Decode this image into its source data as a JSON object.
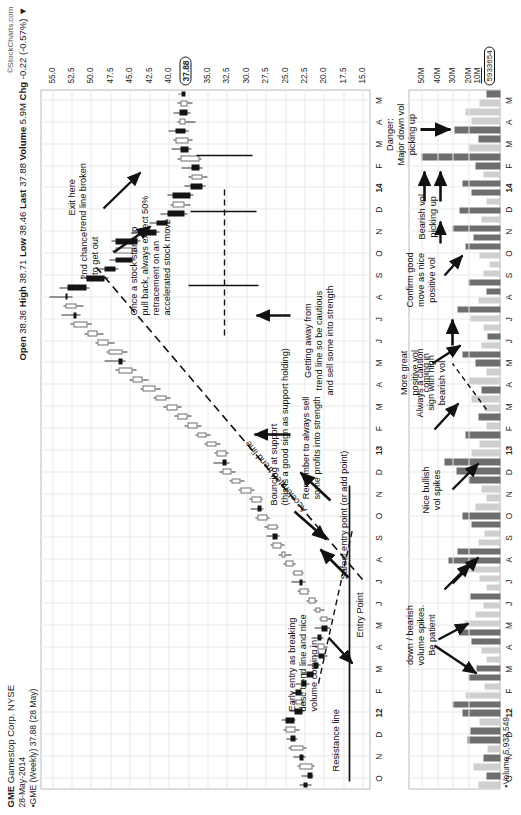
{
  "header": {
    "symbol": "GME",
    "company": "Gamestop Corp. NYSE",
    "date": "28-May-2014",
    "series_label": "GME (Weekly) 37.88 (28 May)",
    "credit": "©StockCharts.com",
    "open_label": "Open",
    "open_value": "38.36",
    "high_label": "High",
    "high_value": "38.71",
    "low_label": "Low",
    "low_value": "38.46",
    "last_label": "Last",
    "last_value": "37.88",
    "volume_label": "Volume",
    "volume_value": "5.9M",
    "chg_label": "Chg",
    "chg_value": "-0.22 (-0.57%)",
    "chg_arrow": "▼"
  },
  "price_axis": {
    "ticks": [
      "55.0",
      "52.5",
      "50.0",
      "47.5",
      "45.0",
      "42.5",
      "40.0",
      "35.0",
      "32.5",
      "30.0",
      "27.5",
      "25.0",
      "22.5",
      "20.0",
      "17.5",
      "15.0"
    ],
    "last_marker": "37.88",
    "min": 14.0,
    "max": 56.5
  },
  "volume_axis": {
    "ticks": [
      "50M",
      "40M",
      "30M",
      "20M"
    ],
    "base_tick": "10M",
    "last_marker": "5933654",
    "footer": "Volume 5,933,549",
    "max": 58
  },
  "x_axis": {
    "labels": [
      "O",
      "N",
      "D",
      "12",
      "F",
      "M",
      "A",
      "M",
      "J",
      "J",
      "A",
      "S",
      "O",
      "N",
      "D",
      "13",
      "F",
      "M",
      "A",
      "M",
      "J",
      "J",
      "A",
      "S",
      "O",
      "N",
      "D",
      "14",
      "F",
      "M",
      "A",
      "M"
    ],
    "bold": [
      "12",
      "13",
      "14"
    ]
  },
  "annotations": {
    "exit_here": "Exit here\ntrend line broken",
    "second_chance": "2nd chance\nto get out",
    "accelerated_trend_line": "Accelerated trend line",
    "getting_away": "Getting away from\ntrend line so be cautious\nand sell some into strength",
    "remember_to_sell": "Remember to always sell\nsome profits into strength",
    "once_a_stock": "Once a stock starts to\npull back, always expect 50%\nretracement on an\naccelerated stock move",
    "safest_entry": "Safest entry point (or add point)",
    "entry_point": "Entry Point",
    "bouncing_at_support": "Bouncing at support\n(this is a good sign as support holding)",
    "early_entry": "Early entry as breaking\ndesc trend line and nice\nvolume coming in",
    "resistance_line": "Resistance line",
    "always_caution": "Always a caution\nsign with high\nbearish vol",
    "nice_bullish_vol": "Nice bullish\nvol spikes",
    "down_bearish": "down / bearish\nvolume spikes.\nBe patient",
    "more_great_vol": "More great\npositive vol\ncoming in",
    "confirm_good_move": "Confirm good\nmove as nice\npositive vol",
    "bearish_vol_picking": "Bearish vol\npicking up",
    "danger_major": "Danger:\nMajor down vol\npicking up"
  },
  "colors": {
    "up_body": "#ffffff",
    "down_body": "#141414",
    "up_volume": "#cfcfcf",
    "down_volume": "#6e6e6e",
    "grid": "#e9e9e9",
    "frame": "#b9b9b9",
    "text": "#111111"
  },
  "chart_data": {
    "type": "candlestick",
    "xlabel": "",
    "ylabel": "Price",
    "ylim": [
      14.0,
      56.5
    ],
    "volume_ylim": [
      0,
      58
    ],
    "grid": true,
    "legend": "none",
    "x": [
      "O",
      "N",
      "D",
      "12",
      "F",
      "M",
      "A",
      "M",
      "J",
      "J",
      "A",
      "S",
      "O",
      "N",
      "D",
      "13",
      "F",
      "M",
      "A",
      "M",
      "J",
      "J",
      "A",
      "S",
      "O",
      "N",
      "D",
      "14",
      "F",
      "M",
      "A",
      "M"
    ],
    "series": [
      {
        "name": "GME weekly OHLC",
        "ohlc": [
          [
            22.6,
            23.2,
            21.6,
            22.1
          ],
          [
            22.1,
            22.9,
            21.3,
            21.5
          ],
          [
            21.5,
            23.4,
            21.2,
            23.1
          ],
          [
            23.1,
            23.9,
            22.4,
            22.6
          ],
          [
            22.6,
            24.6,
            22.3,
            24.3
          ],
          [
            24.3,
            24.8,
            23.4,
            23.6
          ],
          [
            23.6,
            25.2,
            23.1,
            24.9
          ],
          [
            24.9,
            25.4,
            23.6,
            23.8
          ],
          [
            23.8,
            24.4,
            22.5,
            22.8
          ],
          [
            22.8,
            24.0,
            22.4,
            23.7
          ],
          [
            23.7,
            24.2,
            22.6,
            22.9
          ],
          [
            22.9,
            23.6,
            21.9,
            22.2
          ],
          [
            22.2,
            23.0,
            21.0,
            21.3
          ],
          [
            21.3,
            22.1,
            20.4,
            20.7
          ],
          [
            20.7,
            21.4,
            19.6,
            19.9
          ],
          [
            19.9,
            21.1,
            19.5,
            20.8
          ],
          [
            20.8,
            21.6,
            20.0,
            20.3
          ],
          [
            20.3,
            21.2,
            19.2,
            19.5
          ],
          [
            19.5,
            20.6,
            19.0,
            20.4
          ],
          [
            20.4,
            21.4,
            19.9,
            21.1
          ],
          [
            21.1,
            22.3,
            20.8,
            22.0
          ],
          [
            22.0,
            23.4,
            21.8,
            23.1
          ],
          [
            23.1,
            24.2,
            22.4,
            22.8
          ],
          [
            22.8,
            24.1,
            22.6,
            23.9
          ],
          [
            23.9,
            25.2,
            23.6,
            24.9
          ],
          [
            24.9,
            25.8,
            24.2,
            25.5
          ],
          [
            25.5,
            26.9,
            25.1,
            26.6
          ],
          [
            26.6,
            27.4,
            25.7,
            26.0
          ],
          [
            26.0,
            27.6,
            25.8,
            27.3
          ],
          [
            27.3,
            28.8,
            27.0,
            28.5
          ],
          [
            28.5,
            29.4,
            27.8,
            28.1
          ],
          [
            28.1,
            29.6,
            27.9,
            29.3
          ],
          [
            29.3,
            31.0,
            29.0,
            30.7
          ],
          [
            30.7,
            32.2,
            30.2,
            31.9
          ],
          [
            31.9,
            33.4,
            31.4,
            33.1
          ],
          [
            33.1,
            34.2,
            32.2,
            32.6
          ],
          [
            32.6,
            34.1,
            32.3,
            33.8
          ],
          [
            33.8,
            35.4,
            33.3,
            35.1
          ],
          [
            35.1,
            36.6,
            34.6,
            36.3
          ],
          [
            36.3,
            37.9,
            35.8,
            37.6
          ],
          [
            37.6,
            39.2,
            37.0,
            38.9
          ],
          [
            38.9,
            40.6,
            38.3,
            40.3
          ],
          [
            40.3,
            42.0,
            39.7,
            41.7
          ],
          [
            41.7,
            43.6,
            41.1,
            43.3
          ],
          [
            43.3,
            45.0,
            42.6,
            44.7
          ],
          [
            44.7,
            46.8,
            44.1,
            46.5
          ],
          [
            46.5,
            48.2,
            45.6,
            46.0
          ],
          [
            46.0,
            48.0,
            45.3,
            47.7
          ],
          [
            47.7,
            49.4,
            47.0,
            49.1
          ],
          [
            49.1,
            50.8,
            48.4,
            50.5
          ],
          [
            50.5,
            52.6,
            49.9,
            52.3
          ],
          [
            52.3,
            53.8,
            51.4,
            51.8
          ],
          [
            51.8,
            53.6,
            50.9,
            53.3
          ],
          [
            53.3,
            55.4,
            52.4,
            53.0
          ],
          [
            53.0,
            54.0,
            50.2,
            50.6
          ],
          [
            50.6,
            51.4,
            47.8,
            48.2
          ],
          [
            48.2,
            49.0,
            46.4,
            46.8
          ],
          [
            46.8,
            47.6,
            44.2,
            44.6
          ],
          [
            44.6,
            47.2,
            44.0,
            46.9
          ],
          [
            46.9,
            47.4,
            43.6,
            44.0
          ],
          [
            44.0,
            44.6,
            41.2,
            41.6
          ],
          [
            41.6,
            42.4,
            39.8,
            40.2
          ],
          [
            40.2,
            41.0,
            37.6,
            38.0
          ],
          [
            38.0,
            39.8,
            37.2,
            39.5
          ],
          [
            39.5,
            40.2,
            36.8,
            37.2
          ],
          [
            37.2,
            38.0,
            35.2,
            35.6
          ],
          [
            35.6,
            37.4,
            35.0,
            37.1
          ],
          [
            37.1,
            38.4,
            35.6,
            36.0
          ],
          [
            36.0,
            38.8,
            35.8,
            38.5
          ],
          [
            38.5,
            39.6,
            37.1,
            37.5
          ],
          [
            37.5,
            39.4,
            36.9,
            39.1
          ],
          [
            39.1,
            40.0,
            37.4,
            37.8
          ],
          [
            37.8,
            38.9,
            36.6,
            38.6
          ],
          [
            38.6,
            39.4,
            37.2,
            37.6
          ],
          [
            37.6,
            38.8,
            36.9,
            38.5
          ],
          [
            38.36,
            38.71,
            38.46,
            37.88
          ]
        ]
      }
    ],
    "volume": {
      "name": "Volume (weekly)",
      "unit": "shares",
      "values": [
        14,
        9,
        17,
        11,
        8,
        21,
        19,
        13,
        24,
        30,
        22,
        10,
        20,
        15,
        9,
        12,
        18,
        26,
        23,
        16,
        11,
        19,
        9,
        13,
        21,
        33,
        27,
        14,
        10,
        18,
        24,
        16,
        9,
        12,
        20,
        28,
        35,
        18,
        13,
        22,
        9,
        14,
        10,
        18,
        12,
        20,
        9,
        16,
        24,
        12,
        8,
        11,
        19,
        27,
        14,
        9,
        20,
        11,
        7,
        13,
        22,
        17,
        30,
        12,
        26,
        9,
        18,
        24,
        11,
        16,
        50,
        20,
        14,
        29,
        18,
        22,
        13,
        9
      ],
      "direction": [
        "up",
        "dn",
        "up",
        "dn",
        "up",
        "dn",
        "dn",
        "up",
        "dn",
        "dn",
        "up",
        "up",
        "dn",
        "dn",
        "up",
        "up",
        "dn",
        "dn",
        "up",
        "up",
        "up",
        "dn",
        "up",
        "up",
        "up",
        "dn",
        "dn",
        "up",
        "up",
        "dn",
        "dn",
        "up",
        "up",
        "up",
        "dn",
        "dn",
        "dn",
        "up",
        "up",
        "dn",
        "up",
        "dn",
        "up",
        "up",
        "dn",
        "up",
        "up",
        "dn",
        "dn",
        "up",
        "dn",
        "up",
        "up",
        "dn",
        "up",
        "dn",
        "dn",
        "up",
        "up",
        "up",
        "dn",
        "dn",
        "dn",
        "up",
        "dn",
        "up",
        "dn",
        "dn",
        "up",
        "dn",
        "dn",
        "up",
        "dn",
        "dn",
        "up",
        "up",
        "up",
        "dn"
      ]
    }
  }
}
